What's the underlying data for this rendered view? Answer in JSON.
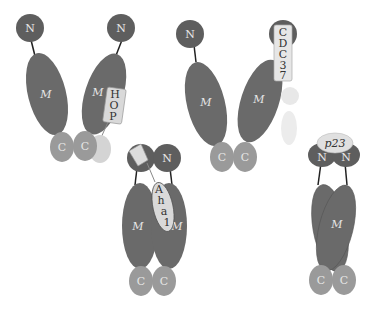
{
  "diagram": {
    "title": "",
    "domains": {
      "n": "N",
      "m": "M",
      "c": "C"
    },
    "colors": {
      "n_domain": "#5e5e5e",
      "m_domain": "#6a6a6a",
      "c_domain": "#9a9a9a",
      "cochaperone": "#d9d9d9",
      "cochaperone_light": "#e8e8e8",
      "linker": "#222222",
      "domain_text": "#e6e6e6",
      "cochaperone_text": "#333333"
    },
    "states": [
      {
        "id": "open-hop",
        "cochaperone": "HOP",
        "cochaperone_letters": [
          "H",
          "O",
          "P"
        ]
      },
      {
        "id": "open-cdc37",
        "cochaperone": "CDC37",
        "cochaperone_letters": [
          "C",
          "D",
          "C",
          "3",
          "7"
        ]
      },
      {
        "id": "closed-aha1",
        "cochaperone": "Aha1",
        "cochaperone_letters": [
          "A",
          "h",
          "a",
          "1"
        ]
      },
      {
        "id": "closed-p23",
        "cochaperone": "p23",
        "cochaperone_letters": [
          "p23"
        ]
      }
    ]
  }
}
